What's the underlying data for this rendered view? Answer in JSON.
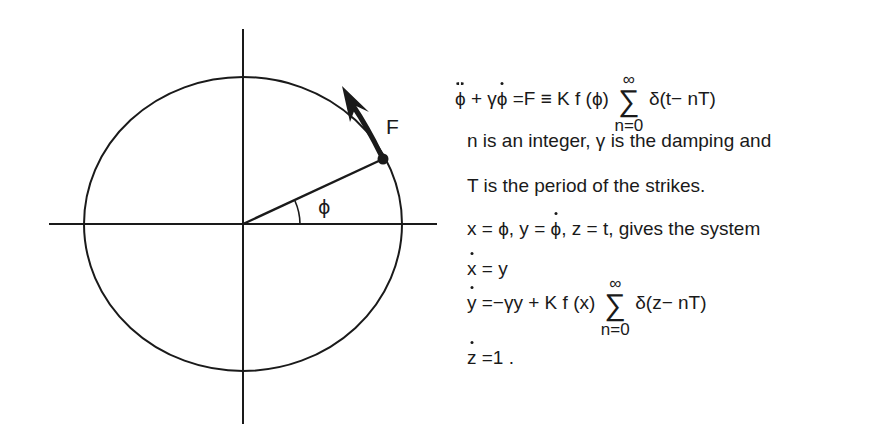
{
  "diagram": {
    "labels": {
      "force": "F",
      "angle": "ϕ"
    },
    "colors": {
      "stroke": "#1a1a1a",
      "background": "#ffffff"
    }
  },
  "equations": {
    "main": {
      "lhs_phi_ddot": "ϕ",
      "plus": "+",
      "gamma": "γ",
      "phi_dot": "ϕ",
      "rhs": "=F ≡ K   f (ϕ)",
      "sum_symbol": "∑",
      "sum_upper": "∞",
      "sum_lower": "n=0",
      "delta_term": "δ(t− nT)"
    },
    "line2": "n  is an integer, γ  is the damping and",
    "line3": "T is the period of the strikes.",
    "line4": {
      "part1": "x  = ϕ, y = ",
      "phi_dot": "ϕ",
      "part2": ", z = t,  gives the system"
    },
    "system": {
      "eq1": {
        "var": "x",
        "rhs": " = y"
      },
      "eq2": {
        "var": "y",
        "rhs": " =−γy + K  f (x)",
        "sum_symbol": "∑",
        "sum_upper": "∞",
        "sum_lower": "n=0",
        "delta_term": "δ(z− nT)"
      },
      "eq3": {
        "var": "z",
        "rhs": " =1 ."
      }
    }
  }
}
